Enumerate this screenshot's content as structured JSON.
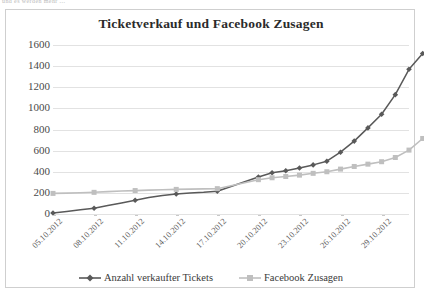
{
  "page": {
    "top_fragment": "und es werden mehr ..."
  },
  "chart_data": {
    "type": "line",
    "title": "Ticketverkauf und Facebook Zusagen",
    "xlabel": "",
    "ylabel": "",
    "ylim": [
      0,
      1600
    ],
    "ytick_step": 200,
    "yticks": [
      1600,
      1400,
      1200,
      1000,
      800,
      600,
      400,
      200,
      0
    ],
    "grid": true,
    "legend_position": "bottom",
    "x": [
      "05.10.2012",
      "06.10.2012",
      "07.10.2012",
      "08.10.2012",
      "09.10.2012",
      "10.10.2012",
      "11.10.2012",
      "12.10.2012",
      "13.10.2012",
      "14.10.2012",
      "15.10.2012",
      "16.10.2012",
      "17.10.2012",
      "18.10.2012",
      "19.10.2012",
      "20.10.2012",
      "21.10.2012",
      "22.10.2012",
      "23.10.2012",
      "24.10.2012",
      "25.10.2012",
      "26.10.2012",
      "27.10.2012",
      "28.10.2012",
      "29.10.2012",
      "30.10.2012",
      "31.10.2012"
    ],
    "xtick_labels": [
      "05.10.2012",
      "08.10.2012",
      "11.10.2012",
      "14.10.2012",
      "17.10.2012",
      "20.10.2012",
      "23.10.2012",
      "26.10.2012",
      "29.10.2012"
    ],
    "xtick_indices": [
      0,
      3,
      6,
      9,
      12,
      15,
      18,
      21,
      24
    ],
    "series": [
      {
        "name": "Anzahl verkaufter Tickets",
        "color": "#595959",
        "marker": "diamond",
        "values": [
          10,
          25,
          40,
          55,
          80,
          105,
          130,
          155,
          175,
          190,
          200,
          205,
          215,
          260,
          305,
          350,
          390,
          410,
          435,
          465,
          500,
          585,
          690,
          815,
          945,
          1130,
          1370
        ]
      },
      {
        "name": "Facebook Zusagen",
        "color": "#bfbfbf",
        "marker": "square",
        "values": [
          195,
          198,
          201,
          205,
          212,
          218,
          222,
          226,
          230,
          233,
          236,
          238,
          240,
          268,
          296,
          325,
          343,
          355,
          368,
          385,
          400,
          425,
          450,
          472,
          495,
          535,
          605
        ]
      }
    ],
    "series_tail": [
      {
        "name": "Anzahl verkaufter Tickets",
        "last_value": 1520
      },
      {
        "name": "Facebook Zusagen",
        "last_value": 715
      }
    ]
  },
  "legend": {
    "items": [
      {
        "label": "Anzahl verkaufter Tickets",
        "color": "#595959",
        "marker": "diamond"
      },
      {
        "label": "Facebook Zusagen",
        "color": "#bfbfbf",
        "marker": "square"
      }
    ]
  }
}
